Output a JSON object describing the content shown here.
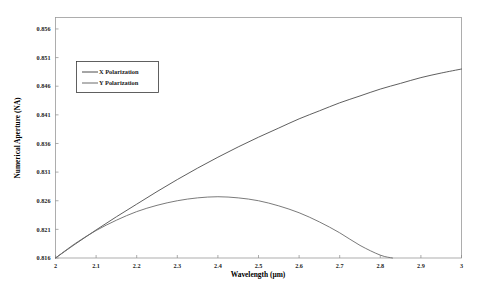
{
  "chart_data": {
    "type": "line",
    "title": "",
    "xlabel": "Wavelength (µm)",
    "ylabel": "Numerical Aperture (NA)",
    "xlim": [
      2,
      3
    ],
    "ylim": [
      0.816,
      0.858
    ],
    "grid": false,
    "legend_position": "upper-left",
    "xticks": [
      "2",
      "2.1",
      "2.2",
      "2.3",
      "2.4",
      "2.5",
      "2.6",
      "2.7",
      "2.8",
      "2.9",
      "3"
    ],
    "xtick_values": [
      2,
      2.1,
      2.2,
      2.3,
      2.4,
      2.5,
      2.6,
      2.7,
      2.8,
      2.9,
      3
    ],
    "yticks": [
      "0.816",
      "0.821",
      "0.826",
      "0.831",
      "0.836",
      "0.841",
      "0.846",
      "0.851",
      "0.856"
    ],
    "ytick_values": [
      0.816,
      0.821,
      0.826,
      0.831,
      0.836,
      0.841,
      0.846,
      0.851,
      0.856
    ],
    "series": [
      {
        "name": "X Polarization",
        "color": "#4d4d4d",
        "x": [
          2.0,
          2.05,
          2.1,
          2.15,
          2.2,
          2.25,
          2.3,
          2.35,
          2.4,
          2.45,
          2.5,
          2.55,
          2.6,
          2.65,
          2.7,
          2.75,
          2.8,
          2.85,
          2.9,
          2.95,
          3.0
        ],
        "values": [
          0.816,
          0.8185,
          0.8209,
          0.8232,
          0.8254,
          0.8276,
          0.8297,
          0.8317,
          0.8336,
          0.8354,
          0.8371,
          0.8387,
          0.8403,
          0.8417,
          0.8431,
          0.8443,
          0.8455,
          0.8465,
          0.8475,
          0.8483,
          0.849
        ]
      },
      {
        "name": "Y Polarization",
        "color": "#6b6b6b",
        "x": [
          2.0,
          2.05,
          2.1,
          2.15,
          2.2,
          2.25,
          2.3,
          2.35,
          2.4,
          2.45,
          2.5,
          2.55,
          2.6,
          2.65,
          2.7,
          2.75,
          2.8,
          2.83
        ],
        "values": [
          0.816,
          0.8186,
          0.8208,
          0.8226,
          0.8241,
          0.8252,
          0.826,
          0.8265,
          0.8267,
          0.8265,
          0.826,
          0.8251,
          0.8239,
          0.8223,
          0.8204,
          0.8182,
          0.8165,
          0.816
        ]
      }
    ],
    "annotations": []
  },
  "legend": {
    "entries": [
      {
        "label": "X Polarization"
      },
      {
        "label": "Y Polarization"
      }
    ]
  }
}
